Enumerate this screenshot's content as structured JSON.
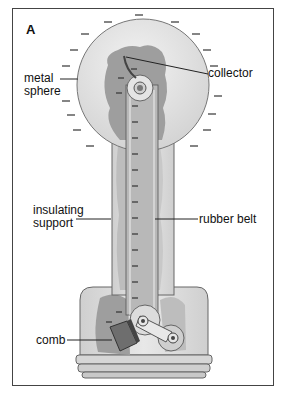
{
  "figure": {
    "panel_letter": "A",
    "labels": {
      "metal_sphere_1": "metal",
      "metal_sphere_2": "sphere",
      "collector": "collector",
      "insulating_support_1": "insulating",
      "insulating_support_2": "support",
      "rubber_belt": "rubber belt",
      "comb": "comb"
    },
    "colors": {
      "sphere": "#e6e6e6",
      "charge_region": "#9e9e9e",
      "support": "#d8d8d8",
      "belt": "#bcbcbc",
      "outline": "#555555",
      "frame": "#444444"
    }
  }
}
